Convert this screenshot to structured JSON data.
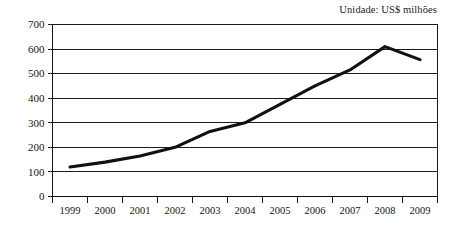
{
  "figure": {
    "unit_label": "Unidade: US$ milhões"
  },
  "chart_data": {
    "type": "line",
    "title": "",
    "subtitle": "",
    "annotations": [
      "Unidade: US$ milhões"
    ],
    "xlabel": "",
    "ylabel": "",
    "categories": [
      "1999",
      "2000",
      "2001",
      "2002",
      "2003",
      "2004",
      "2005",
      "2006",
      "2007",
      "2008",
      "2009"
    ],
    "series": [
      {
        "name": "US$ milhões",
        "values": [
          120,
          140,
          165,
          200,
          265,
          300,
          375,
          450,
          515,
          610,
          557
        ],
        "color": "#111111"
      }
    ],
    "ylim": [
      0,
      700
    ],
    "ytick_values": [
      0,
      100,
      200,
      300,
      400,
      500,
      600,
      700
    ],
    "ytick_labels": [
      "0",
      "100",
      "200",
      "300",
      "400",
      "500",
      "600",
      "700"
    ],
    "xtick_labels": [
      "1999",
      "2000",
      "2001",
      "2002",
      "2003",
      "2004",
      "2005",
      "2006",
      "2007",
      "2008",
      "2009"
    ],
    "grid": true,
    "grid_axis": "y",
    "legend": false,
    "legend_position": "none"
  }
}
